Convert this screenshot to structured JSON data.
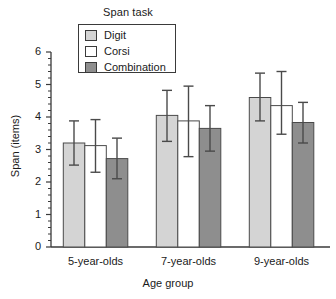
{
  "chart_data": {
    "type": "bar",
    "title": "",
    "xlabel": "Age group",
    "ylabel": "Span (items)",
    "categories": [
      "5-year-olds",
      "7-year-olds",
      "9-year-olds"
    ],
    "ylim": [
      0,
      6
    ],
    "yticks": [
      0,
      1,
      2,
      3,
      4,
      5,
      6
    ],
    "ytick_labels": [
      "0",
      "1",
      "2",
      "3",
      "4",
      "5",
      "6"
    ],
    "minor_ticks": true,
    "grid": false,
    "legend_title": "Span task",
    "legend_position": "top-center",
    "error_bars": "symmetric",
    "series": [
      {
        "name": "Digit",
        "color": "#d4d4d4",
        "values": [
          3.2,
          4.05,
          4.6
        ],
        "err_low": [
          2.52,
          3.25,
          3.88
        ],
        "err_high": [
          3.88,
          4.82,
          5.35
        ]
      },
      {
        "name": "Corsi",
        "color": "#ffffff",
        "values": [
          3.12,
          3.88,
          4.35
        ],
        "err_low": [
          2.3,
          2.78,
          3.47
        ],
        "err_high": [
          3.92,
          4.95,
          5.4
        ]
      },
      {
        "name": "Combination",
        "color": "#8e8e8e",
        "values": [
          2.72,
          3.65,
          3.83
        ],
        "err_low": [
          2.1,
          2.95,
          3.2
        ],
        "err_high": [
          3.35,
          4.35,
          4.45
        ]
      }
    ]
  },
  "legend": {
    "title": "Span task",
    "items": [
      {
        "label": "Digit",
        "color": "#d4d4d4"
      },
      {
        "label": "Corsi",
        "color": "#ffffff"
      },
      {
        "label": "Combination",
        "color": "#8e8e8e"
      }
    ]
  },
  "axes": {
    "y_label": "Span (items)",
    "x_label": "Age group",
    "y_ticks": [
      "6",
      "5",
      "4",
      "3",
      "2",
      "1",
      "0"
    ],
    "x_ticks": [
      "5-year-olds",
      "7-year-olds",
      "9-year-olds"
    ]
  },
  "style": {
    "axis_color": "#3a3a3a",
    "bar_edge": "#4a4a4a",
    "error_color": "#4a4a4a",
    "background": "#ffffff"
  }
}
